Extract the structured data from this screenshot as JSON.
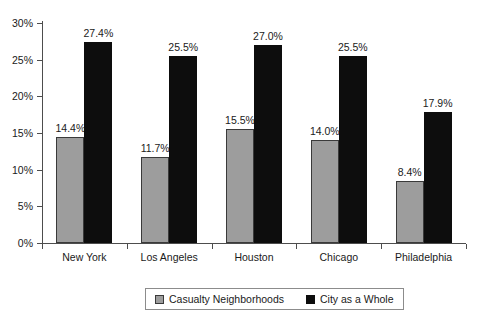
{
  "chart_data": {
    "type": "bar",
    "title": "",
    "xlabel": "",
    "ylabel": "",
    "ylim": [
      0,
      30
    ],
    "ytick_labels": [
      "0%",
      "5%",
      "10%",
      "15%",
      "20%",
      "25%",
      "30%"
    ],
    "ytick_values": [
      0,
      5,
      10,
      15,
      20,
      25,
      30
    ],
    "grid": false,
    "legend_position": "bottom",
    "categories": [
      "New York",
      "Los Angeles",
      "Houston",
      "Chicago",
      "Philadelphia"
    ],
    "series": [
      {
        "name": "Casualty Neighborhoods",
        "color": "#9d9d9d",
        "values": [
          14.4,
          11.7,
          15.5,
          14.0,
          8.4
        ],
        "labels": [
          "14.4%",
          "11.7%",
          "15.5%",
          "14.0%",
          "8.4%"
        ]
      },
      {
        "name": "City as a Whole",
        "color": "#0d0d0d",
        "values": [
          27.4,
          25.5,
          27.0,
          25.5,
          17.9
        ],
        "labels": [
          "27.4%",
          "25.5%",
          "27.0%",
          "25.5%",
          "17.9%"
        ]
      }
    ]
  },
  "legend": {
    "entries": [
      {
        "label": "Casualty Neighborhoods",
        "swatch": "gray"
      },
      {
        "label": "City as a Whole",
        "swatch": "black"
      }
    ]
  }
}
